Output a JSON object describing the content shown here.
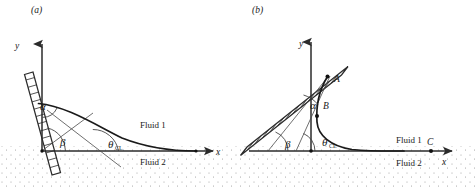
{
  "figure": {
    "panels": [
      {
        "id": "a",
        "label": "(a)",
        "axis_x_label": "x",
        "axis_y_label": "y",
        "fluid_upper_label": "Fluid 1",
        "fluid_lower_label": "Fluid 2",
        "angles": [
          {
            "name": "alpha",
            "symbol": "α"
          },
          {
            "name": "beta",
            "symbol": "β"
          },
          {
            "name": "theta-cl",
            "symbol": "θ",
            "subscript": "CL"
          }
        ],
        "points": []
      },
      {
        "id": "b",
        "label": "(b)",
        "axis_x_label": "x",
        "axis_y_label": "y",
        "fluid_upper_label": "Fluid 1",
        "fluid_lower_label": "Fluid 2",
        "angles": [
          {
            "name": "alpha",
            "symbol": "α"
          },
          {
            "name": "beta",
            "symbol": "β"
          },
          {
            "name": "theta-cl",
            "symbol": "θ",
            "subscript": "CL"
          }
        ],
        "points": [
          {
            "name": "point-a",
            "label": "A"
          },
          {
            "name": "point-b",
            "label": "B"
          },
          {
            "name": "point-c",
            "label": "C"
          }
        ]
      }
    ],
    "colors": {
      "ink": "#1a1a1a",
      "axis": "#2b2b2b",
      "arc": "#3a3a3a",
      "stipple": "#9a9a9a",
      "background": "#ffffff"
    }
  }
}
